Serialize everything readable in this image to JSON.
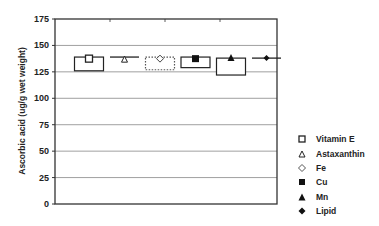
{
  "chart_data": {
    "type": "bar",
    "subtype": "range-box with mean markers",
    "title": "",
    "xlabel": "",
    "ylabel": "Ascorbic acid (ug/g wet weight)",
    "ylim": [
      0,
      175
    ],
    "yticks": [
      0,
      25,
      50,
      75,
      100,
      125,
      150,
      175
    ],
    "grid": true,
    "legend_position": "right",
    "categories": [
      "Vitamin E",
      "Astaxanthin",
      "Fe",
      "Cu",
      "Mn",
      "Lipid"
    ],
    "series": [
      {
        "name": "Vitamin E",
        "marker": "open-square",
        "mean": 137.5,
        "upper": 139,
        "lower": 126,
        "box_style": "solid"
      },
      {
        "name": "Astaxanthin",
        "marker": "open-triangle",
        "mean": 137,
        "upper": 139,
        "lower": 139,
        "box_style": "line"
      },
      {
        "name": "Fe",
        "marker": "open-diamond",
        "mean": 137.5,
        "upper": 139,
        "lower": 127,
        "box_style": "dotted"
      },
      {
        "name": "Cu",
        "marker": "filled-square",
        "mean": 137.5,
        "upper": 139,
        "lower": 129,
        "box_style": "solid"
      },
      {
        "name": "Mn",
        "marker": "filled-triangle",
        "mean": 138,
        "upper": 138,
        "lower": 122,
        "box_style": "solid"
      },
      {
        "name": "Lipid",
        "marker": "filled-diamond",
        "mean": 138,
        "upper": 138,
        "lower": 138,
        "box_style": "line"
      }
    ]
  },
  "legend": [
    {
      "label": "Vitamin E",
      "icon": "open-square-icon"
    },
    {
      "label": "Astaxanthin",
      "icon": "open-triangle-icon"
    },
    {
      "label": "Fe",
      "icon": "open-diamond-icon"
    },
    {
      "label": "Cu",
      "icon": "filled-square-icon"
    },
    {
      "label": "Mn",
      "icon": "filled-triangle-icon"
    },
    {
      "label": "Lipid",
      "icon": "filled-diamond-icon"
    }
  ]
}
